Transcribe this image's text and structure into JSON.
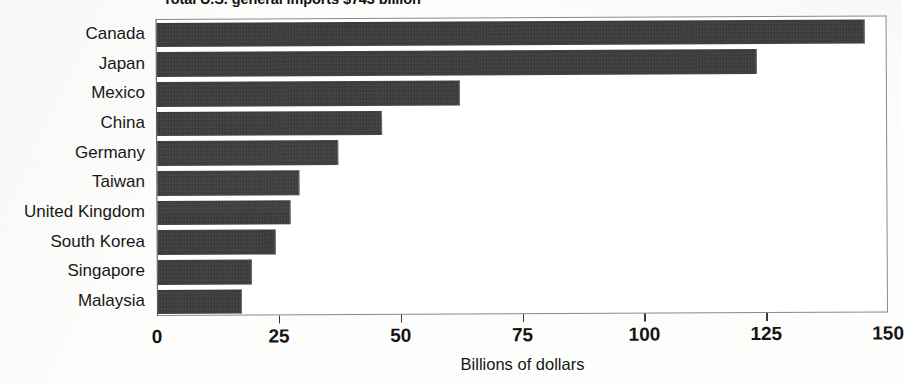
{
  "chart_data": {
    "type": "bar",
    "orientation": "horizontal",
    "title": "Total U.S. general imports $743 billion",
    "xlabel": "Billions of dollars",
    "ylabel": "",
    "xlim": [
      0,
      150
    ],
    "xticks": [
      0,
      25,
      50,
      75,
      100,
      125,
      150
    ],
    "xtick_labels": [
      "0",
      "25",
      "50",
      "75",
      "100",
      "125",
      "150"
    ],
    "grid": false,
    "legend": null,
    "categories": [
      "Canada",
      "Japan",
      "Mexico",
      "China",
      "Germany",
      "Taiwan",
      "United Kingdom",
      "South Korea",
      "Singapore",
      "Malaysia"
    ],
    "values": [
      145,
      123,
      62,
      46,
      37,
      29,
      27,
      24,
      19,
      17
    ],
    "bar_color": "#3b3b3b",
    "units": "billions of dollars"
  },
  "axis": {
    "x_title": "Billions of dollars"
  }
}
